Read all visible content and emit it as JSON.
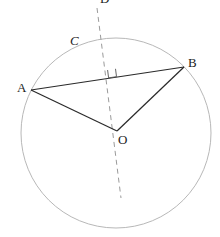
{
  "diagram": {
    "type": "geometry",
    "colors": {
      "circle": "#b8b8b8",
      "segments": "#2a2a2a",
      "dashed": "#9a9a9a",
      "labels": "#222222"
    },
    "labels": {
      "circle": "C",
      "point_a": "A",
      "point_b": "B",
      "center": "O",
      "top": "D"
    },
    "points": {
      "A": [
        31,
        90
      ],
      "B": [
        184,
        67
      ],
      "O": [
        117,
        131
      ]
    },
    "circle": {
      "cx": 116,
      "cy": 133,
      "r": 95
    }
  }
}
